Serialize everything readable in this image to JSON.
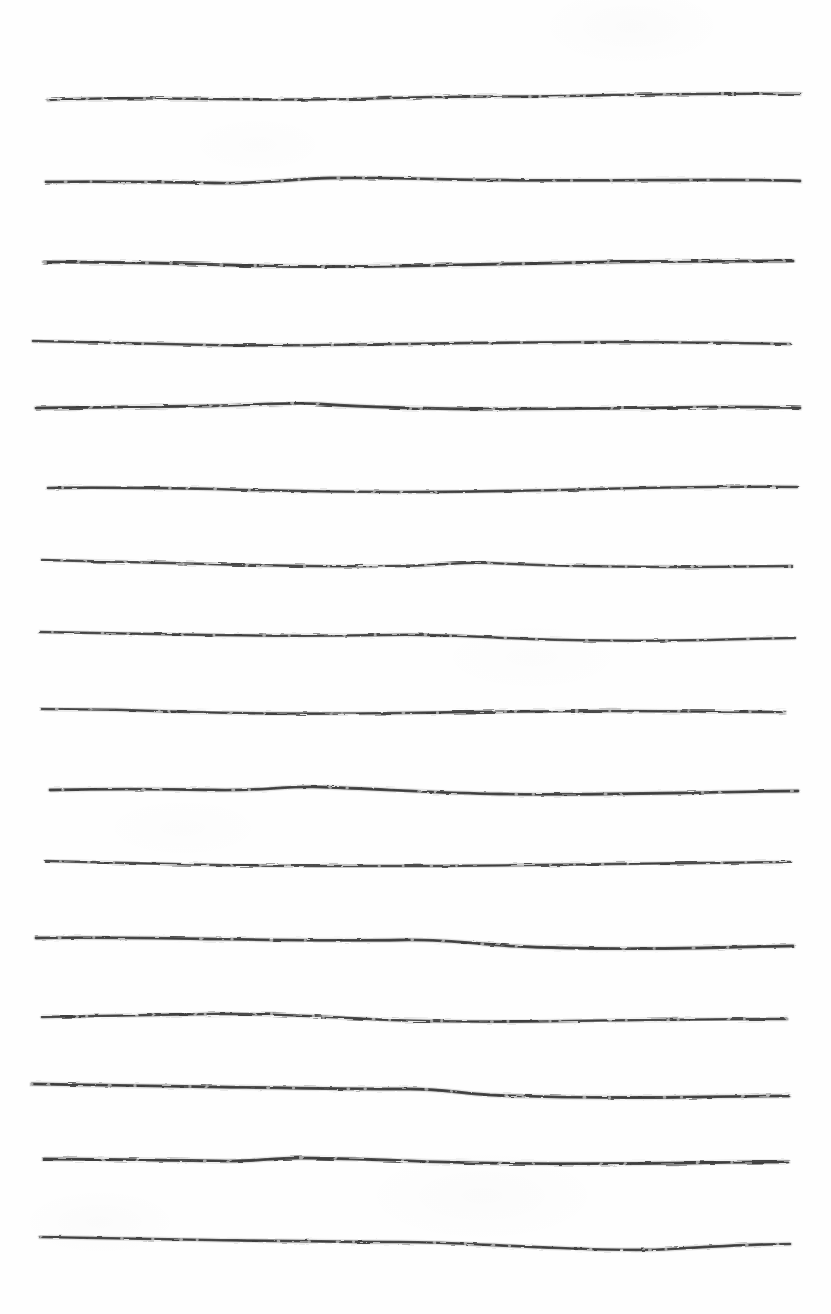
{
  "document": {
    "kind": "scanned-paper-artwork",
    "title": "Hand-drawn horizontal rule lines",
    "width": 831,
    "height": 1314,
    "background_color": "#fefefe",
    "paper_color": "#fefefe",
    "ink_color": "#4a4a4a",
    "ink_color_dark": "#3a3a3a",
    "ink_color_light": "#6e6e6e",
    "stroke_count": 16,
    "orientation": "portrait",
    "medium": "ink pen on white paper",
    "has_text": false,
    "has_caption": false
  },
  "chart_data": {
    "type": "line",
    "title": "",
    "xlabel": "",
    "ylabel": "",
    "grid": false,
    "legend": false,
    "xlim": [
      0,
      831
    ],
    "ylim": [
      0,
      1314
    ],
    "note": "Sixteen freehand horizontal ink strokes spanning the page, roughly evenly spaced.",
    "series": [
      {
        "name": "stroke-1",
        "y_baseline": 99,
        "x_start": 48,
        "x_end": 800,
        "thickness": 2.6,
        "opacity": 0.92,
        "path": "M48,100 C90,98 150,98 210,99 C280,100 330,100 390,98 C450,96 500,97 560,96 C620,95 700,93 800,94"
      },
      {
        "name": "stroke-2",
        "y_baseline": 182,
        "x_start": 46,
        "x_end": 800,
        "thickness": 2.8,
        "opacity": 0.94,
        "path": "M46,182 C100,181 160,182 215,183 C260,184 290,179 330,178 C390,177 440,180 500,180 C570,181 650,180 720,180 C760,180 780,180 800,181"
      },
      {
        "name": "stroke-3",
        "y_baseline": 263,
        "x_start": 44,
        "x_end": 793,
        "thickness": 3.0,
        "opacity": 0.95,
        "path": "M44,262 C100,262 170,263 230,265 C290,267 340,267 400,266 C470,265 540,263 610,262 C680,261 740,261 793,261"
      },
      {
        "name": "stroke-4",
        "y_baseline": 343,
        "x_start": 33,
        "x_end": 790,
        "thickness": 2.6,
        "opacity": 0.9,
        "path": "M33,341 C90,342 150,344 210,345 C280,346 340,345 400,344 C470,343 540,342 610,342 C680,342 740,343 790,344"
      },
      {
        "name": "stroke-5",
        "y_baseline": 408,
        "x_start": 36,
        "x_end": 800,
        "thickness": 2.8,
        "opacity": 0.93,
        "path": "M36,408 C90,407 150,407 210,406 C260,405 290,402 320,404 C380,408 440,409 500,409 C570,409 650,408 720,407 C760,407 780,407 800,408"
      },
      {
        "name": "stroke-6",
        "y_baseline": 489,
        "x_start": 48,
        "x_end": 797,
        "thickness": 2.6,
        "opacity": 0.9,
        "path": "M48,488 C100,487 160,488 215,489 C280,491 340,492 400,492 C460,492 510,491 560,490 C630,488 700,486 797,487"
      },
      {
        "name": "stroke-7",
        "y_baseline": 563,
        "x_start": 42,
        "x_end": 792,
        "thickness": 2.5,
        "opacity": 0.88,
        "path": "M42,560 C90,561 150,563 210,564 C280,566 340,567 400,566 C440,565 465,562 490,563 C550,566 620,567 690,567 C740,567 770,566 792,566"
      },
      {
        "name": "stroke-8",
        "y_baseline": 634,
        "x_start": 40,
        "x_end": 795,
        "thickness": 2.5,
        "opacity": 0.9,
        "path": "M40,632 C90,633 150,634 210,635 C270,636 330,636 390,635 C440,634 480,637 530,639 C590,641 650,641 710,640 C750,639 775,638 795,638"
      },
      {
        "name": "stroke-9",
        "y_baseline": 710,
        "x_start": 41,
        "x_end": 785,
        "thickness": 2.6,
        "opacity": 0.89,
        "path": "M41,709 C90,709 140,710 190,712 C260,714 330,714 400,713 C470,712 540,711 610,711 C680,711 740,712 785,712"
      },
      {
        "name": "stroke-10",
        "y_baseline": 789,
        "x_start": 50,
        "x_end": 798,
        "thickness": 2.8,
        "opacity": 0.93,
        "path": "M50,790 C100,789 160,789 215,790 C260,791 285,786 320,787 C380,789 440,793 500,794 C560,795 620,794 680,793 C730,792 770,791 798,791"
      },
      {
        "name": "stroke-11",
        "y_baseline": 862,
        "x_start": 46,
        "x_end": 790,
        "thickness": 2.4,
        "opacity": 0.87,
        "path": "M46,861 C100,862 160,864 215,865 C280,866 340,866 400,866 C470,866 540,865 610,864 C680,863 740,862 790,862"
      },
      {
        "name": "stroke-12",
        "y_baseline": 938,
        "x_start": 36,
        "x_end": 793,
        "thickness": 2.8,
        "opacity": 0.93,
        "path": "M36,938 C90,937 150,938 210,939 C280,940 340,941 400,940 C440,939 470,943 510,946 C570,949 640,949 700,948 C750,947 775,946 793,946"
      },
      {
        "name": "stroke-13",
        "y_baseline": 1016,
        "x_start": 42,
        "x_end": 787,
        "thickness": 2.6,
        "opacity": 0.9,
        "path": "M42,1017 C90,1016 150,1015 210,1014 C270,1013 330,1017 390,1020 C450,1022 510,1022 570,1021 C640,1020 710,1019 787,1019"
      },
      {
        "name": "stroke-14",
        "y_baseline": 1086,
        "x_start": 32,
        "x_end": 789,
        "thickness": 2.9,
        "opacity": 0.94,
        "path": "M32,1084 C90,1085 160,1086 220,1087 C290,1088 350,1089 410,1089 C440,1089 460,1093 490,1095 C560,1098 630,1098 700,1097 C750,1096 775,1096 789,1096"
      },
      {
        "name": "stroke-15",
        "y_baseline": 1160,
        "x_start": 44,
        "x_end": 788,
        "thickness": 2.9,
        "opacity": 0.94,
        "path": "M44,1159 C100,1159 160,1160 220,1161 C250,1162 270,1158 300,1158 C360,1158 420,1162 480,1163 C550,1164 620,1164 690,1163 C740,1162 770,1162 788,1162"
      },
      {
        "name": "stroke-16",
        "y_baseline": 1240,
        "x_start": 40,
        "x_end": 790,
        "thickness": 2.7,
        "opacity": 0.92,
        "path": "M40,1237 C90,1238 150,1239 210,1240 C280,1241 340,1242 400,1242 C450,1242 500,1246 560,1248 C610,1250 640,1251 670,1249 C720,1246 760,1244 790,1244"
      }
    ]
  }
}
